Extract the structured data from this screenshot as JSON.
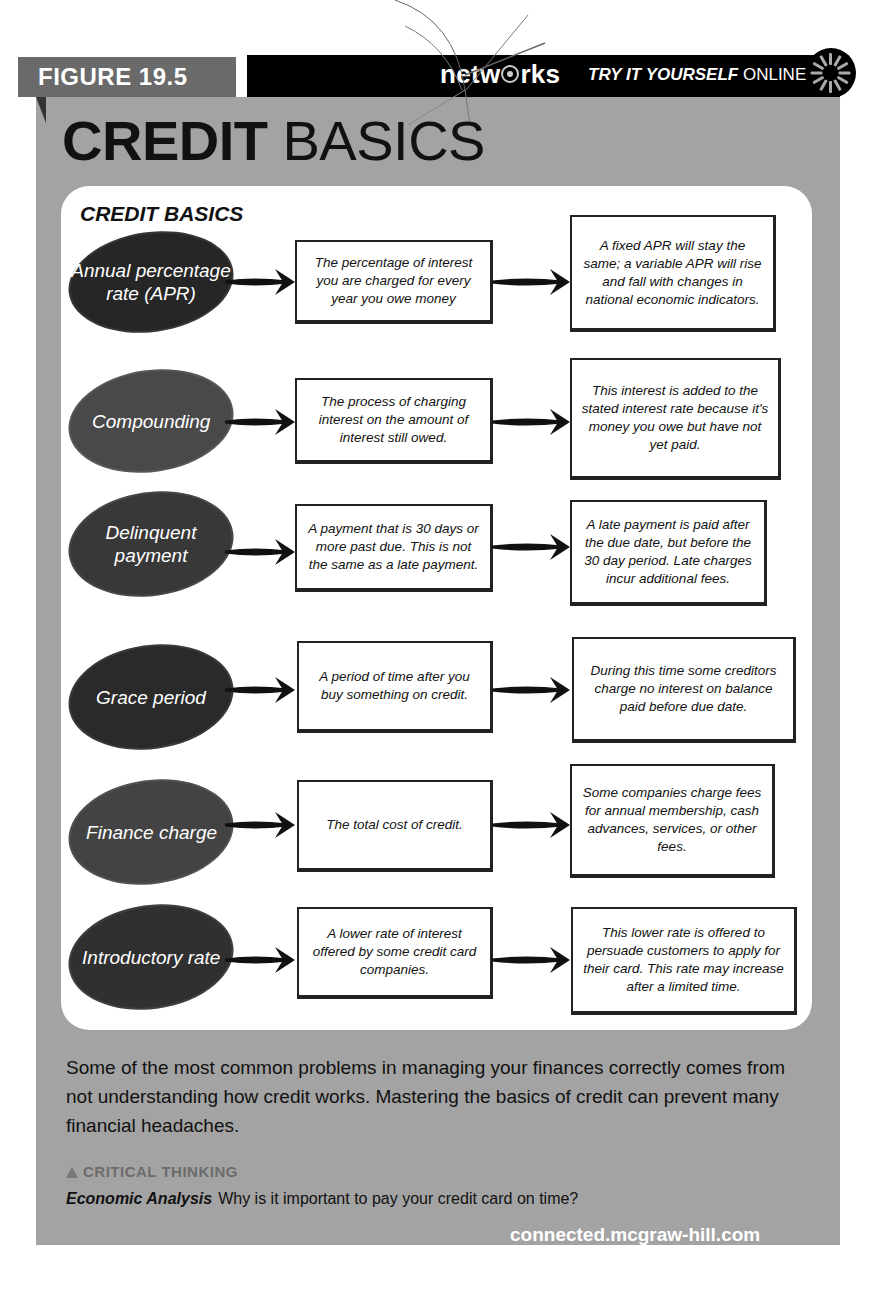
{
  "header": {
    "top_cut_text": "...n't necessarily pay...",
    "figure_label": "FIGURE 19.5",
    "logo_pre": "netw",
    "logo_post": "rks",
    "try_it_bold": "TRY IT YOURSELF",
    "try_it_rest": " ONLINE"
  },
  "title": {
    "bold": "CREDIT",
    "light": " BASICS"
  },
  "diagram": {
    "title": "CREDIT BASICS",
    "rows": [
      {
        "term": "Annual percentage rate (APR)",
        "definition": "The percentage of interest you are charged for every year you owe money",
        "detail": "A fixed APR will stay the same; a variable APR will rise and fall with changes in national economic indicators.",
        "color": "#262626"
      },
      {
        "term": "Compounding",
        "definition": "The process of charging interest on the amount of interest still owed.",
        "detail": "This interest is added to the stated interest rate because it's money you owe but have not yet paid.",
        "color": "#494949"
      },
      {
        "term": "Delinquent payment",
        "definition": "A payment that is 30 days or more past due. This is not the same as a late payment.",
        "detail": "A late payment is paid after the due date, but before the 30 day period. Late charges incur additional fees.",
        "color": "#383838"
      },
      {
        "term": "Grace period",
        "definition": "A period of time after you buy something on credit.",
        "detail": "During this time some creditors charge no interest on balance paid before due date.",
        "color": "#2a2a2a"
      },
      {
        "term": "Finance charge",
        "definition": "The total cost of credit.",
        "detail": "Some companies charge fees for annual membership, cash advances, services, or other fees.",
        "color": "#434343"
      },
      {
        "term": "Introductory rate",
        "definition": "A lower rate of interest offered by some credit card companies.",
        "detail": "This lower rate is offered to persuade customers to apply for their card. This rate may increase after a limited time.",
        "color": "#303030"
      }
    ]
  },
  "caption": {
    "paragraph": "Some of the most common problems in managing your finances correctly comes from not understanding how credit works. Mastering the basics of credit can prevent many financial headaches.",
    "critical_thinking_label": "CRITICAL THINKING",
    "question_label": "Economic Analysis",
    "question": "Why is it important to pay your credit card on time?",
    "link": "connected.mcgraw-hill.com"
  },
  "colors": {
    "panel": "#a3a3a3",
    "figure_tab": "#6a6a6a",
    "bar": "#000000",
    "card": "#ffffff"
  }
}
